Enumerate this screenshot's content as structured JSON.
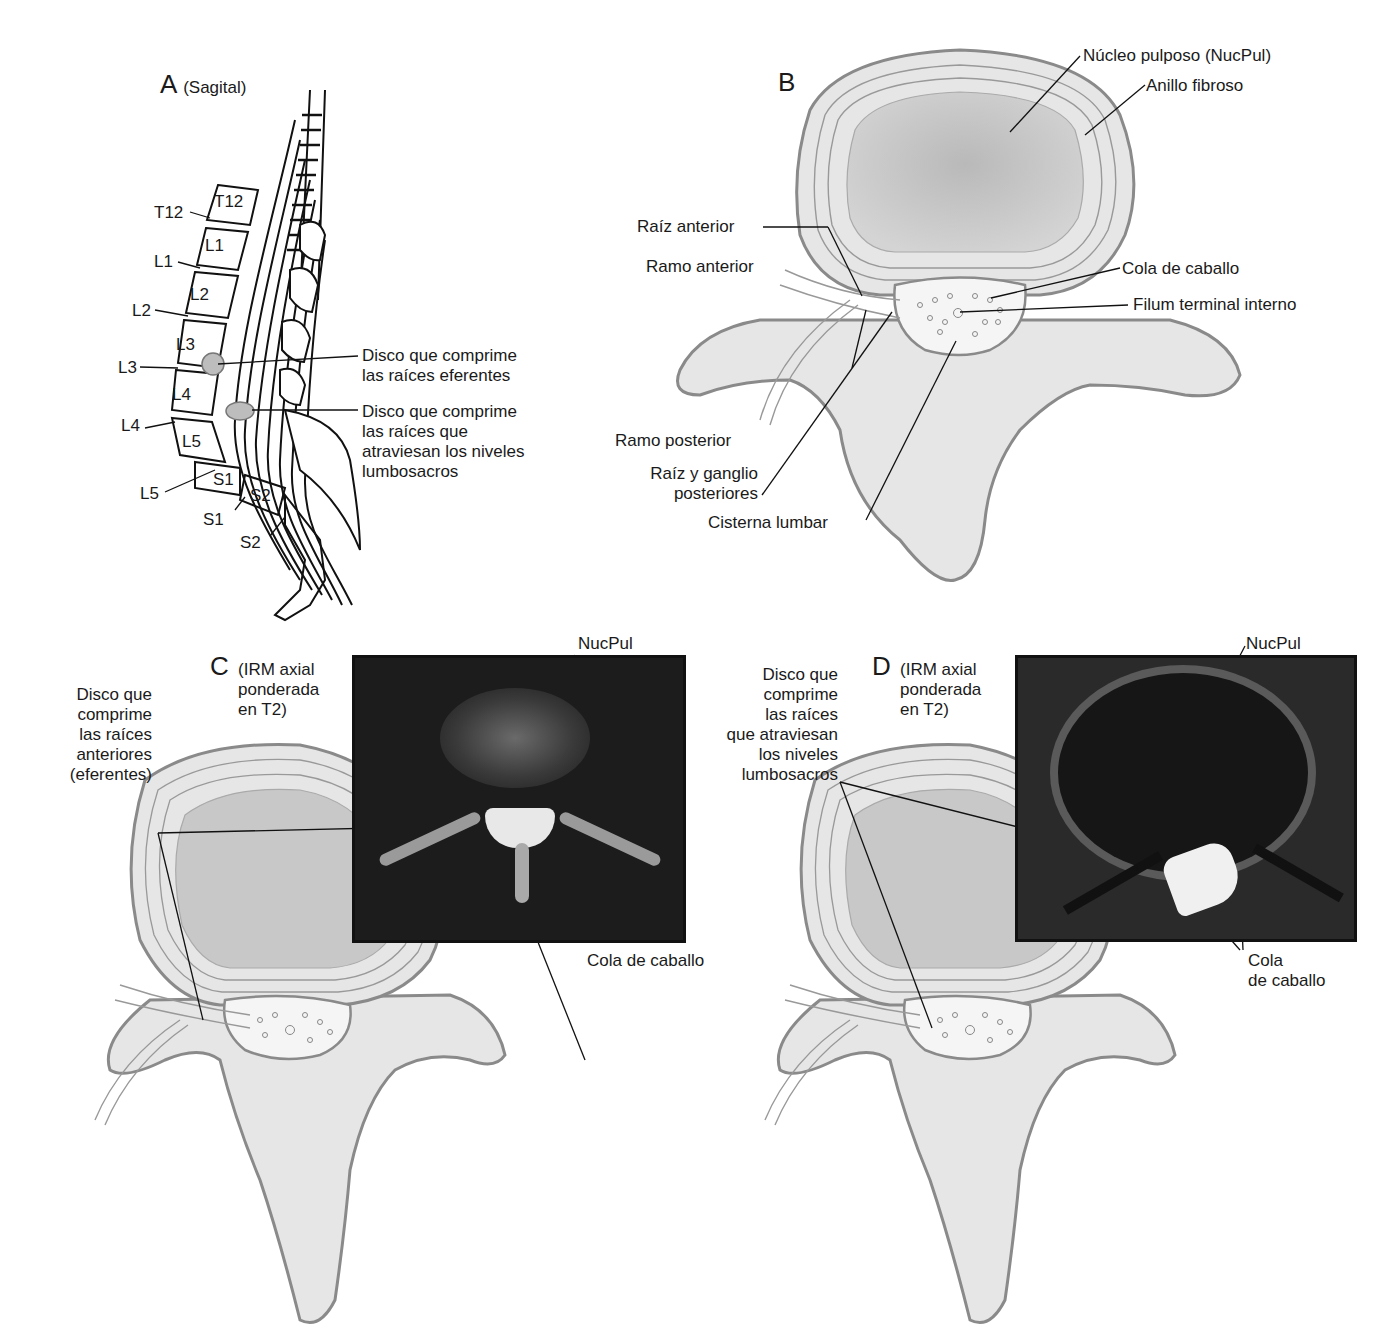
{
  "panels": {
    "A": {
      "letter": "A",
      "subtitle": "(Sagital)",
      "vertebra_labels": [
        "T12",
        "L1",
        "L2",
        "L3",
        "L4",
        "L5",
        "S1",
        "S2"
      ],
      "disc_labels": [
        "T12",
        "L1",
        "L2",
        "L3",
        "L4",
        "L5",
        "S1",
        "S2"
      ],
      "callouts": [
        "Disco que comprime\nlas raíces eferentes",
        "Disco que comprime\nlas raíces que\natraviesan los niveles\nlumbosacros"
      ]
    },
    "B": {
      "letter": "B",
      "callouts": {
        "nucleus": "Núcleo pulposo (NucPul)",
        "annulus": "Anillo fibroso",
        "anterior_root": "Raíz anterior",
        "anterior_ramus": "Ramo anterior",
        "cauda_equina": "Cola de caballo",
        "filum": "Filum terminal interno",
        "posterior_ramus": "Ramo posterior",
        "posterior_root": "Raíz y ganglio\nposteriores",
        "lumbar_cistern": "Cisterna lumbar"
      }
    },
    "C": {
      "letter": "C",
      "subtitle": "(IRM axial\nponderada\nen T2)",
      "callouts": {
        "disc": "Disco que\ncomprime\nlas raíces\nanteriores\n(eferentes)",
        "nucpul": "NucPul",
        "cauda": "Cola de caballo"
      }
    },
    "D": {
      "letter": "D",
      "subtitle": "(IRM axial\nponderada\nen T2)",
      "callouts": {
        "disc": "Disco que\ncomprime\nlas raíces\nque atraviesan\nlos niveles\nlumbosacros",
        "nucpul": "NucPul",
        "cauda": "Cola\nde caballo"
      }
    }
  },
  "colors": {
    "bone_fill": "#e6e6e6",
    "bone_stroke": "#8a8a8a",
    "nucleus_fill": "#c4c4c4",
    "disc_highlight": "#bdbdbd",
    "mri_bg": "#1c1c1c",
    "line": "#111111"
  }
}
